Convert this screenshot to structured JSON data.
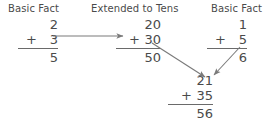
{
  "diagram": {
    "background_color": "#ffffff",
    "text_color": "#4a4a4a",
    "rule_color": "#6a6a6a",
    "arrow_color": "#7a7a7a",
    "headings": [
      {
        "id": "left",
        "label": "Basic Fact"
      },
      {
        "id": "middle",
        "label": "Extended to Tens"
      },
      {
        "id": "right",
        "label": "Basic Fact"
      }
    ],
    "problems": [
      {
        "id": "basic-fact-ones",
        "top_addend": "2",
        "operator": "+",
        "bottom_addend": "3",
        "sum": "5"
      },
      {
        "id": "extended-to-tens",
        "top_addend": "20",
        "operator": "+",
        "bottom_addend": "30",
        "sum": "50"
      },
      {
        "id": "basic-fact-ones-right",
        "top_addend": "1",
        "operator": "+",
        "bottom_addend": "5",
        "sum": "6"
      },
      {
        "id": "combined-result",
        "top_addend": "21",
        "operator": "+",
        "bottom_addend": "35",
        "sum": "56"
      }
    ],
    "arrows": [
      {
        "id": "left-to-middle",
        "direction": "right"
      },
      {
        "id": "middle-to-bottom",
        "direction": "down-right"
      },
      {
        "id": "right-to-bottom",
        "direction": "down-left"
      }
    ]
  }
}
